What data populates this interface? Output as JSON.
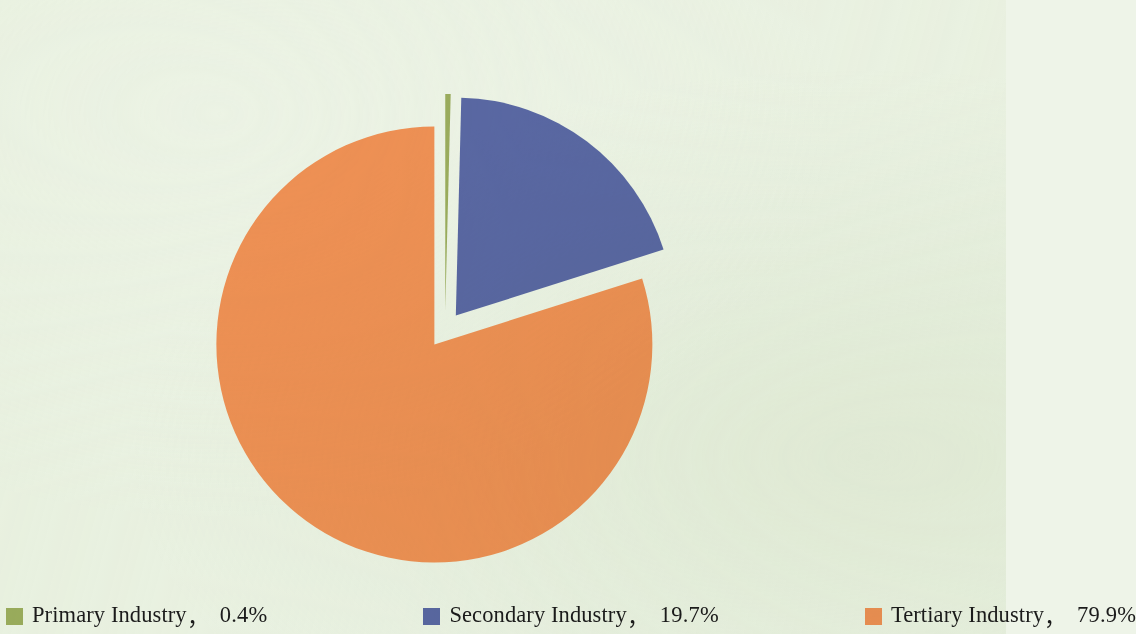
{
  "figure": {
    "background_color": "#eef4e8",
    "text_color": "#1b1b1b"
  },
  "chart_data": {
    "type": "pie",
    "title": "",
    "subtitle": "",
    "xlabel": "",
    "ylabel": "",
    "grid": false,
    "legend_position": "bottom",
    "exploded": true,
    "start_angle_deg": 0,
    "direction": "clockwise",
    "categories": [
      "Primary Industry",
      "Secondary Industry",
      "Tertiary Industry"
    ],
    "values": [
      0.4,
      19.7,
      79.9
    ],
    "value_suffix": "%",
    "colors": [
      "#9cad5e",
      "#5a68a5",
      "#f09155"
    ],
    "slices": [
      {
        "name": "Primary Industry",
        "value": 0.4,
        "value_label": "0.4%",
        "color": "#9cad5e"
      },
      {
        "name": "Secondary Industry",
        "value": 19.7,
        "value_label": "19.7%",
        "color": "#5a68a5"
      },
      {
        "name": "Tertiary Industry",
        "value": 79.9,
        "value_label": "79.9%",
        "color": "#f09155"
      }
    ]
  },
  "legend": {
    "separator": "，",
    "items": [
      {
        "label": "Primary Industry",
        "value": "0.4%",
        "color": "#9cad5e",
        "swatch_name": "legend-swatch-primary-industry"
      },
      {
        "label": "Secondary Industry",
        "value": "19.7%",
        "color": "#5a68a5",
        "swatch_name": "legend-swatch-secondary-industry"
      },
      {
        "label": "Tertiary Industry",
        "value": "79.9%",
        "color": "#f09155",
        "swatch_name": "legend-swatch-tertiary-industry"
      }
    ]
  }
}
